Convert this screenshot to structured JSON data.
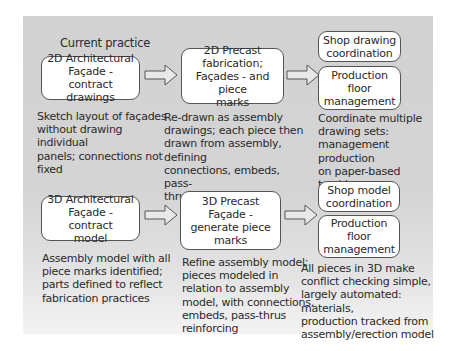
{
  "diagram": {
    "heading": "Current practice",
    "current_practice": {
      "step1": {
        "box": "2D Architectural\nFaçade - contract\ndrawings",
        "description": "Sketch layout of façades\nwithout drawing individual\npanels; connections not\nfixed"
      },
      "step2": {
        "box": "2D Precast\nfabrication;\nFaçades - and piece\nmarks",
        "description": "Re-drawn as assembly\ndrawings; each piece then\ndrawn from assembly, defining\nconnections, embeds, pass-\nthrus, reinforcing"
      },
      "step3": {
        "box_top": "Shop drawing\ncoordination",
        "box_bottom": "Production\nfloor\nmanagement",
        "description": "Coordinate multiple\ndrawing sets:\nmanagement production\non paper-based tracking"
      }
    },
    "model_practice": {
      "step1": {
        "box": "3D Architectural\nFaçade - contract\nmodel",
        "description": "Assembly model with all\npiece marks identified;\nparts defined to reflect\nfabrication practices"
      },
      "step2": {
        "box": "3D Precast\nFaçade -\ngenerate piece\nmarks",
        "description": "Refine assembly model;\npieces modeled in\nrelation to assembly\nmodel, with connections,\nembeds, pass-thrus\nreinforcing"
      },
      "step3": {
        "box_top": "Shop model\ncoordination",
        "box_bottom": "Production\nfloor\nmanagement",
        "description": "All pieces in 3D make\nconflict checking simple,\nlargely automated: materials,\nproduction tracked from\nassembly/erection model"
      }
    },
    "icons": {
      "flow_arrow": "block-arrow-right"
    },
    "colors": {
      "panel_background": "#d2d2d2",
      "box_fill": "#ffffff",
      "box_border": "#555555",
      "text": "#2a2a2a"
    }
  }
}
